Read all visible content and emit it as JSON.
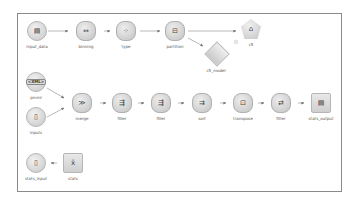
{
  "canvas": {
    "border_color": "#8a8a8a",
    "background": "#ffffff"
  },
  "nodes": [
    {
      "id": "input_data",
      "label": "input_data",
      "shape": "circle",
      "icon": "file-source-icon"
    },
    {
      "id": "binning",
      "label": "binning",
      "shape": "hex",
      "icon": "binning-icon"
    },
    {
      "id": "type",
      "label": "type",
      "shape": "hex",
      "icon": "type-icon"
    },
    {
      "id": "partition",
      "label": "partition",
      "shape": "hex",
      "icon": "partition-icon"
    },
    {
      "id": "c5",
      "label": "c5",
      "shape": "pent",
      "icon": "c5-model-builder-icon"
    },
    {
      "id": "c5_model",
      "label": "c5_model",
      "shape": "diamond",
      "icon": "c5-model-nugget-icon"
    },
    {
      "id": "pmml",
      "label": "pmml",
      "shape": "circle",
      "icon": "xml-source-icon",
      "tag": "<XML>"
    },
    {
      "id": "inputs",
      "label": "inputs",
      "shape": "circle",
      "icon": "file-source-icon"
    },
    {
      "id": "merge",
      "label": "merge",
      "shape": "hex",
      "icon": "merge-icon"
    },
    {
      "id": "filler1",
      "label": "filler",
      "shape": "hex",
      "icon": "filler-icon"
    },
    {
      "id": "filler2",
      "label": "filler",
      "shape": "hex",
      "icon": "filler-icon"
    },
    {
      "id": "sort",
      "label": "sort",
      "shape": "hex",
      "icon": "sort-icon"
    },
    {
      "id": "transpose",
      "label": "transpose",
      "shape": "hex",
      "icon": "transpose-icon"
    },
    {
      "id": "filter",
      "label": "filter",
      "shape": "hex",
      "icon": "filter-icon"
    },
    {
      "id": "stats_output",
      "label": "stats_output",
      "shape": "square",
      "icon": "output-file-icon"
    },
    {
      "id": "stats_input",
      "label": "stats_input",
      "shape": "circle",
      "icon": "file-source-icon"
    },
    {
      "id": "stats",
      "label": "stats",
      "shape": "square",
      "icon": "stats-icon"
    }
  ],
  "edges": [
    [
      "input_data",
      "binning"
    ],
    [
      "binning",
      "type"
    ],
    [
      "type",
      "partition"
    ],
    [
      "partition",
      "c5"
    ],
    [
      "partition",
      "c5_model"
    ],
    [
      "pmml",
      "merge"
    ],
    [
      "inputs",
      "merge"
    ],
    [
      "merge",
      "filler1"
    ],
    [
      "filler1",
      "filler2"
    ],
    [
      "filler2",
      "sort"
    ],
    [
      "sort",
      "transpose"
    ],
    [
      "transpose",
      "filter"
    ],
    [
      "filter",
      "stats_output"
    ],
    [
      "stats",
      "stats_input"
    ]
  ]
}
